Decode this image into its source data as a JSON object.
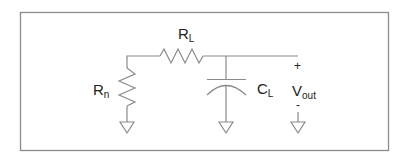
{
  "diagram": {
    "type": "circuit-schematic",
    "frame_color": "#8c8c8c",
    "wire_color": "#8a8a8a",
    "components": {
      "rn": {
        "symbol": "R",
        "subscript": "n",
        "kind": "resistor",
        "orientation": "vertical"
      },
      "rl": {
        "symbol": "R",
        "subscript": "L",
        "kind": "resistor",
        "orientation": "horizontal"
      },
      "cl": {
        "symbol": "C",
        "subscript": "L",
        "kind": "capacitor",
        "orientation": "vertical"
      }
    },
    "output": {
      "symbol": "V",
      "subscript": "out",
      "plus": "+",
      "minus": "-"
    },
    "grounds": [
      "rn-ground",
      "cl-ground",
      "vout-ground"
    ]
  }
}
